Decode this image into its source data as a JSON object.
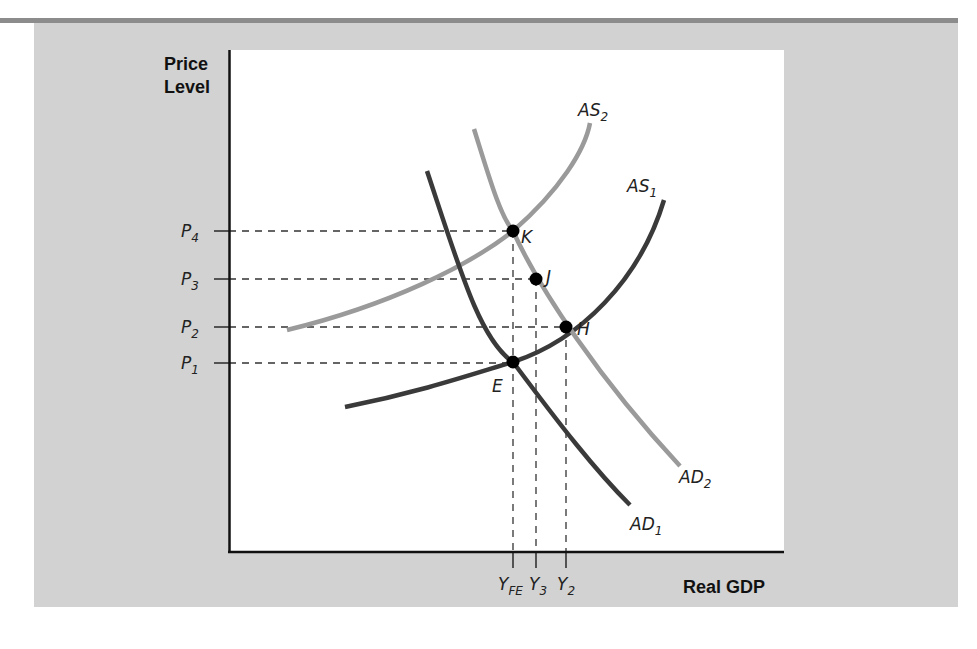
{
  "chart_data": {
    "type": "line",
    "title": "",
    "xlabel": "Real GDP",
    "ylabel": [
      "Price",
      "Level"
    ],
    "grid": false,
    "legend": "none (curves labeled inline)",
    "colors": {
      "panel_bg": "#d2d2d2",
      "plot_bg": "#ffffff",
      "dark_curve": "#3a3a3a",
      "light_curve": "#9a9a9a",
      "top_rule": "#8c8c8c"
    },
    "y_ticks": [
      {
        "base": "P",
        "sub": "4",
        "y_px": 231
      },
      {
        "base": "P",
        "sub": "3",
        "y_px": 279
      },
      {
        "base": "P",
        "sub": "2",
        "y_px": 327
      },
      {
        "base": "P",
        "sub": "1",
        "y_px": 363
      }
    ],
    "x_ticks": [
      {
        "base": "Y",
        "sub": "FE",
        "x_px": 513
      },
      {
        "base": "Y",
        "sub": "3",
        "x_px": 536
      },
      {
        "base": "Y",
        "sub": "2",
        "x_px": 566
      }
    ],
    "series": [
      {
        "name": "AS1",
        "base": "AS",
        "sub": "1",
        "shade": "dark",
        "path": "M345,407 C420,392 470,375 513,362 C580,340 640,280 664,200",
        "label_xy": [
          627,
          192
        ]
      },
      {
        "name": "AS2",
        "base": "AS",
        "sub": "2",
        "shade": "light",
        "path": "M287,330 C390,305 470,265 513,231 C560,190 585,150 590,123",
        "label_xy": [
          578,
          116
        ]
      },
      {
        "name": "AD1",
        "base": "AD",
        "sub": "1",
        "shade": "dark",
        "path": "M427,171 C460,270 480,340 513,362 C560,425 595,470 630,505",
        "label_xy": [
          630,
          530
        ]
      },
      {
        "name": "AD2",
        "base": "AD",
        "sub": "2",
        "shade": "light",
        "path": "M474,129 C490,180 500,215 513,231 C540,290 600,380 680,466",
        "label_xy": [
          679,
          483
        ]
      }
    ],
    "points": [
      {
        "name": "E",
        "x_px": 513,
        "y_px": 362,
        "label_xy": [
          492,
          392
        ],
        "meaning": "AS1 ∩ AD1 at (Y_FE, P1)"
      },
      {
        "name": "H",
        "x_px": 566,
        "y_px": 327,
        "label_xy": [
          577,
          335
        ],
        "meaning": "AS1 ∩ AD2 at (Y2, P2)"
      },
      {
        "name": "J",
        "x_px": 536,
        "y_px": 279,
        "label_xy": [
          546,
          283
        ],
        "meaning": "(Y3, P3)"
      },
      {
        "name": "K",
        "x_px": 513,
        "y_px": 231,
        "label_xy": [
          521,
          243
        ],
        "meaning": "AS2 ∩ AD2 at (Y_FE, P4)"
      }
    ],
    "guides": {
      "horizontal": [
        {
          "from": "P4",
          "y": 231,
          "x_end": 513
        },
        {
          "from": "P3",
          "y": 279,
          "x_end": 536
        },
        {
          "from": "P2",
          "y": 327,
          "x_end": 566
        },
        {
          "from": "P1",
          "y": 363,
          "x_end": 513
        }
      ],
      "vertical": [
        {
          "to": "YFE",
          "x": 513,
          "y_start": 231
        },
        {
          "to": "Y3",
          "x": 536,
          "y_start": 279
        },
        {
          "to": "Y2",
          "x": 566,
          "y_start": 327
        }
      ]
    },
    "plot_area": {
      "x0": 229,
      "y0": 50,
      "x1": 784,
      "y1": 552
    }
  }
}
